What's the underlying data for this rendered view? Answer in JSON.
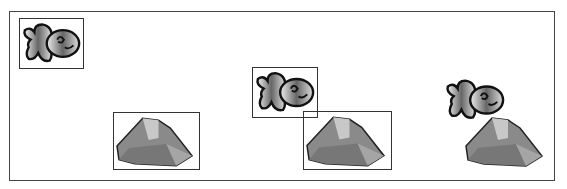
{
  "figure": {
    "panels": [
      {
        "label": "separate",
        "fish_boxed": true,
        "rock_boxed": true
      },
      {
        "label": "overlapping",
        "fish_boxed": true,
        "rock_boxed": true
      },
      {
        "label": "composed",
        "fish_boxed": false,
        "rock_boxed": false
      }
    ],
    "icons": [
      "fish-icon",
      "rock-icon"
    ],
    "colors": {
      "frame": "#444444",
      "box": "#333333",
      "fish_fill": "#9a9a9a",
      "rock_fill": "#8c8c8c"
    }
  }
}
